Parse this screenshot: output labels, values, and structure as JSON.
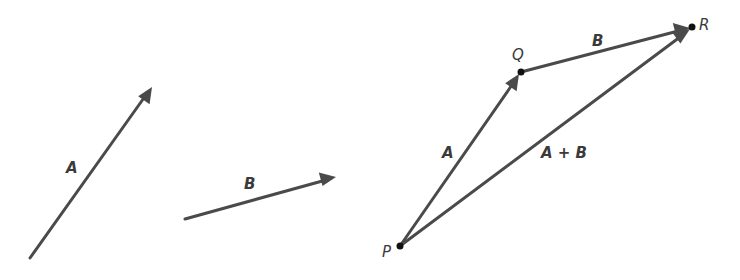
{
  "figure": {
    "colors": {
      "line": "#4a4a4a",
      "text": "#3a3a3a",
      "point": "#111111"
    }
  },
  "left": {
    "vector_a": {
      "label": "A",
      "from": [
        30,
        258
      ],
      "to": [
        152,
        87
      ]
    },
    "vector_b": {
      "label": "B",
      "from": [
        185,
        219
      ],
      "to": [
        336,
        177
      ]
    }
  },
  "right": {
    "points": {
      "P": {
        "label": "P",
        "xy": [
          400,
          246
        ]
      },
      "Q": {
        "label": "Q",
        "xy": [
          521,
          72
        ]
      },
      "R": {
        "label": "R",
        "xy": [
          692,
          27
        ]
      }
    },
    "vector_a": {
      "label": "A"
    },
    "vector_b": {
      "label": "B"
    },
    "resultant": {
      "label": "A + B"
    }
  }
}
